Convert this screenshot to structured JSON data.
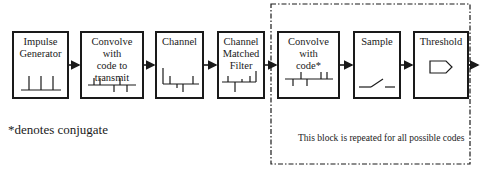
{
  "diagram": {
    "blocks": [
      {
        "id": "impulse",
        "label_lines": [
          "Impulse",
          "Generator"
        ],
        "glyph": "impulse-train"
      },
      {
        "id": "conv_tx",
        "label_lines": [
          "Convolve with",
          "code to",
          "transmit"
        ],
        "glyph": "coded-sequence"
      },
      {
        "id": "channel",
        "label_lines": [
          "Channel"
        ],
        "glyph": "channel-response"
      },
      {
        "id": "matched",
        "label_lines": [
          "Channel",
          "Matched",
          "Filter"
        ],
        "glyph": "matched-response"
      },
      {
        "id": "conv_rx",
        "label_lines": [
          "Convolve with",
          "code*"
        ],
        "glyph": "conjugate-code-sequence"
      },
      {
        "id": "sample",
        "label_lines": [
          "Sample"
        ],
        "glyph": "switch"
      },
      {
        "id": "threshold",
        "label_lines": [
          "Threshold"
        ],
        "glyph": "threshold-pentagon"
      }
    ],
    "footnote": "*denotes conjugate",
    "repeat_note": "This block is repeated for all possible codes",
    "colors": {
      "stroke": "#1a1a1a",
      "background": "#ffffff"
    }
  }
}
